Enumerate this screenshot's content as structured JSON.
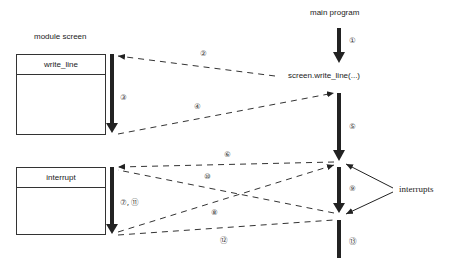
{
  "modules": {
    "left_title": "module screen",
    "right_title": "main program",
    "call_label": "screen.write_line(...)",
    "procedures": [
      {
        "name": "write_line"
      },
      {
        "name": "interrupt"
      }
    ],
    "interrupts_label": "interrupts"
  },
  "steps": {
    "s1": "①",
    "s2": "②",
    "s3": "③",
    "s4": "④",
    "s5": "⑤",
    "s6": "⑥",
    "s7_11": "⑦, ⑪",
    "s8": "⑧",
    "s9": "⑨",
    "s10": "⑩",
    "s12": "⑫",
    "s13": "⑬"
  },
  "colors": {
    "line": "#222222",
    "background": "#ffffff"
  }
}
